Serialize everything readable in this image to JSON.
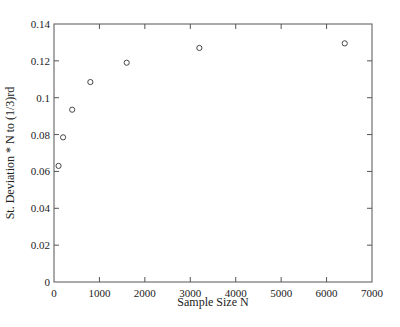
{
  "chart_data": {
    "type": "scatter",
    "title": "",
    "xlabel": "Sample Size N",
    "ylabel": "St. Deviation * N  to (1/3)rd",
    "xlim": [
      0,
      7000
    ],
    "ylim": [
      0,
      0.14
    ],
    "xticks": [
      0,
      1000,
      2000,
      3000,
      4000,
      5000,
      6000,
      7000
    ],
    "xtick_labels": [
      "0",
      "1000",
      "2000",
      "3000",
      "4000",
      "5000",
      "6000",
      "7000"
    ],
    "yticks": [
      0,
      0.02,
      0.04,
      0.06,
      0.08,
      0.1,
      0.12,
      0.14
    ],
    "ytick_labels": [
      "0",
      "0.02",
      "0.04",
      "0.06",
      "0.08",
      "0.1",
      "0.12",
      "0.14"
    ],
    "grid": false,
    "legend": null,
    "marker": "open-circle",
    "series": [
      {
        "name": "St. Deviation * N^(1/3)",
        "x": [
          100,
          200,
          400,
          800,
          1600,
          3200,
          6400
        ],
        "y": [
          0.063,
          0.0785,
          0.0935,
          0.1085,
          0.119,
          0.127,
          0.1295
        ]
      }
    ]
  },
  "colors": {
    "axis": "#555555",
    "marker": "#333333",
    "text": "#222222"
  }
}
